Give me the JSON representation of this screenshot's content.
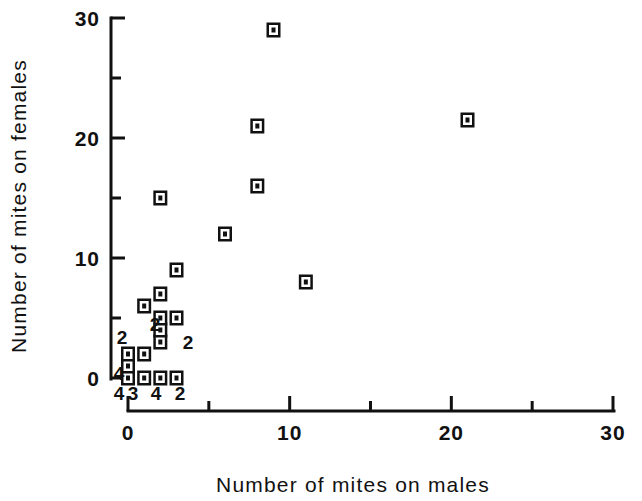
{
  "chart_data": {
    "type": "scatter",
    "title": "",
    "xlabel": "Number of mites on males",
    "ylabel": "Number of mites on females",
    "xlim": [
      0,
      30
    ],
    "ylim": [
      0,
      30
    ],
    "grid": false,
    "legend": null,
    "x_ticks_major": [
      0,
      10,
      20,
      30
    ],
    "x_ticks_minor": [
      5,
      15,
      25
    ],
    "y_ticks_major": [
      0,
      10,
      20,
      30
    ],
    "y_ticks_minor": [
      5,
      15,
      25
    ],
    "x_tick_labels": [
      "0",
      "10",
      "20",
      "30"
    ],
    "y_tick_labels": [
      "0",
      "10",
      "20",
      "30"
    ],
    "points": [
      {
        "x": 0,
        "y": 0,
        "count": 4,
        "label": "4"
      },
      {
        "x": 0,
        "y": 1,
        "count": 1,
        "label": ""
      },
      {
        "x": 0,
        "y": 2,
        "count": 2,
        "label": "2"
      },
      {
        "x": 1,
        "y": 0,
        "count": 3,
        "label": "3"
      },
      {
        "x": 1,
        "y": 2,
        "count": 1,
        "label": ""
      },
      {
        "x": 2,
        "y": 0,
        "count": 4,
        "label": "4"
      },
      {
        "x": 2,
        "y": 3,
        "count": 2,
        "label": "2"
      },
      {
        "x": 2,
        "y": 4,
        "count": 1,
        "label": ""
      },
      {
        "x": 2,
        "y": 5,
        "count": 2,
        "label": "2"
      },
      {
        "x": 2,
        "y": 7,
        "count": 1,
        "label": ""
      },
      {
        "x": 3,
        "y": 0,
        "count": 2,
        "label": "2"
      },
      {
        "x": 1,
        "y": 6,
        "count": 1,
        "label": ""
      },
      {
        "x": 3,
        "y": 9,
        "count": 1,
        "label": ""
      },
      {
        "x": 2,
        "y": 15,
        "count": 1,
        "label": ""
      },
      {
        "x": 3,
        "y": 5,
        "count": 1,
        "label": ""
      },
      {
        "x": 6,
        "y": 12,
        "count": 1,
        "label": ""
      },
      {
        "x": 8,
        "y": 16,
        "count": 1,
        "label": ""
      },
      {
        "x": 8,
        "y": 21,
        "count": 1,
        "label": ""
      },
      {
        "x": 9,
        "y": 29,
        "count": 1,
        "label": ""
      },
      {
        "x": 11,
        "y": 8,
        "count": 1,
        "label": ""
      },
      {
        "x": 21,
        "y": 21.5,
        "count": 1,
        "label": ""
      }
    ],
    "count_labels": [
      {
        "text": "2",
        "x_px": 122,
        "y_px": 344
      },
      {
        "text": "2",
        "x_px": 155,
        "y_px": 331
      },
      {
        "text": "2",
        "x_px": 188,
        "y_px": 349
      },
      {
        "text": "4",
        "x_px": 119,
        "y_px": 380
      },
      {
        "text": "4",
        "x_px": 119,
        "y_px": 400
      },
      {
        "text": "3",
        "x_px": 133,
        "y_px": 400
      },
      {
        "text": "4",
        "x_px": 156,
        "y_px": 400
      },
      {
        "text": "2",
        "x_px": 180,
        "y_px": 400
      }
    ]
  },
  "axes": {
    "x_title": "Number of mites on males",
    "y_title": "Number of mites on females"
  },
  "colors": {
    "ink": "#111111",
    "background": "#ffffff"
  }
}
